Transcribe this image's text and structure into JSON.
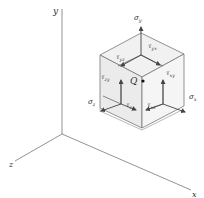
{
  "figure": {
    "axes": {
      "x": "x",
      "y": "y",
      "z": "z"
    },
    "point_label": "Q",
    "normal_stresses": {
      "sigma_x": "σx",
      "sigma_y": "σy",
      "sigma_z": "σz"
    },
    "shear_stresses": {
      "tau_yx": "τyx",
      "tau_yz": "τyz",
      "tau_zy": "τzy",
      "tau_xy": "τxy",
      "tau_zx": "τzx",
      "tau_xz": "τxz"
    },
    "colors": {
      "line": "#6b6b6b",
      "face_top": "#f0f0f0",
      "face_left": "#e9e9e9",
      "face_right": "#f4f4f4",
      "arrow": "#555555",
      "text": "#333333"
    }
  },
  "labels": {
    "y_axis": "y",
    "z_axis": "z",
    "x_axis": "x",
    "Q": "Q",
    "sigma_y": "σ",
    "sigma_y_sub": "y",
    "sigma_x": "σ",
    "sigma_x_sub": "x",
    "sigma_z": "σ",
    "sigma_z_sub": "z",
    "tau_yx": "τ",
    "tau_yx_sub": "yx",
    "tau_yz": "τ",
    "tau_yz_sub": "yz",
    "tau_zy": "τ",
    "tau_zy_sub": "zy",
    "tau_xy": "τ",
    "tau_xy_sub": "xy",
    "tau_zx": "τ",
    "tau_zx_sub": "zx",
    "tau_xz": "τ",
    "tau_xz_sub": "xz"
  }
}
